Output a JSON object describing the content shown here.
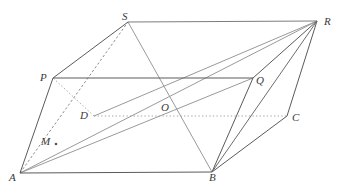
{
  "figure": {
    "width": 349,
    "height": 193,
    "background_color": "#ffffff",
    "stroke_colors": {
      "solid_dark": "#5a5a5a",
      "solid_mid": "#7d7d7d",
      "solid_light": "#9a9a9a",
      "dashed": "#8d8d8d",
      "dotted": "#a8a8a8"
    },
    "label_color": "#3a3a3a"
  },
  "points": {
    "A": {
      "label": "A",
      "x": 20,
      "y": 173,
      "label_x": 9,
      "label_y": 172
    },
    "B": {
      "label": "B",
      "x": 212,
      "y": 172,
      "label_x": 209,
      "label_y": 172
    },
    "C": {
      "label": "C",
      "x": 287,
      "y": 116,
      "label_x": 292,
      "label_y": 112
    },
    "D": {
      "label": "D",
      "x": 94,
      "y": 116,
      "label_x": 80,
      "label_y": 110
    },
    "P": {
      "label": "P",
      "x": 53,
      "y": 78,
      "label_x": 40,
      "label_y": 72
    },
    "Q": {
      "label": "Q",
      "x": 253,
      "y": 78,
      "label_x": 256,
      "label_y": 75
    },
    "R": {
      "label": "R",
      "x": 317,
      "y": 21,
      "label_x": 324,
      "label_y": 16
    },
    "S": {
      "label": "S",
      "x": 128,
      "y": 22,
      "label_x": 122,
      "label_y": 11
    },
    "O": {
      "label": "O",
      "x": 167,
      "y": 112,
      "label_x": 161,
      "label_y": 102
    },
    "M": {
      "label": "M",
      "x": 56,
      "y": 144,
      "label_x": 41,
      "label_y": 136
    }
  },
  "edges": [
    {
      "name": "edge-A-B",
      "from": "A",
      "to": "B",
      "style": "solid",
      "shade": "solid_dark"
    },
    {
      "name": "edge-A-P",
      "from": "A",
      "to": "P",
      "style": "solid",
      "shade": "solid_dark"
    },
    {
      "name": "edge-P-Q",
      "from": "P",
      "to": "Q",
      "style": "solid",
      "shade": "solid_dark"
    },
    {
      "name": "edge-P-S",
      "from": "P",
      "to": "S",
      "style": "solid",
      "shade": "solid_dark"
    },
    {
      "name": "edge-S-R",
      "from": "S",
      "to": "R",
      "style": "solid",
      "shade": "solid_mid"
    },
    {
      "name": "edge-Q-R",
      "from": "Q",
      "to": "R",
      "style": "solid",
      "shade": "solid_dark"
    },
    {
      "name": "edge-B-Q",
      "from": "B",
      "to": "Q",
      "style": "solid",
      "shade": "solid_dark"
    },
    {
      "name": "edge-B-C",
      "from": "B",
      "to": "C",
      "style": "solid",
      "shade": "solid_dark"
    },
    {
      "name": "edge-C-R",
      "from": "C",
      "to": "R",
      "style": "solid",
      "shade": "solid_dark"
    },
    {
      "name": "edge-D-C-hidden",
      "from": "D",
      "to": "C",
      "style": "dotted",
      "shade": "dotted"
    },
    {
      "name": "edge-D-P-hidden",
      "from": "D",
      "to": "P",
      "style": "dotted",
      "shade": "dotted"
    },
    {
      "name": "diagonal-S-B",
      "from": "S",
      "to": "B",
      "style": "solid",
      "shade": "solid_light"
    },
    {
      "name": "diagonal-A-R",
      "from": "A",
      "to": "R",
      "style": "solid",
      "shade": "solid_light"
    },
    {
      "name": "diagonal-A-Q",
      "from": "A",
      "to": "Q",
      "style": "solid",
      "shade": "solid_light"
    },
    {
      "name": "diagonal-B-R",
      "from": "B",
      "to": "R",
      "style": "solid",
      "shade": "solid_dark"
    },
    {
      "name": "diagonal-D-R",
      "from": "D",
      "to": "R",
      "style": "solid",
      "shade": "solid_light"
    },
    {
      "name": "diagonal-A-S-through-M-D",
      "from": "A",
      "to": "S",
      "style": "dashed",
      "shade": "dashed"
    }
  ],
  "marked_points": [
    {
      "name": "point-marker-M",
      "point": "M"
    }
  ],
  "labels_order": [
    "S",
    "R",
    "P",
    "Q",
    "D",
    "O",
    "C",
    "M",
    "A",
    "B"
  ]
}
